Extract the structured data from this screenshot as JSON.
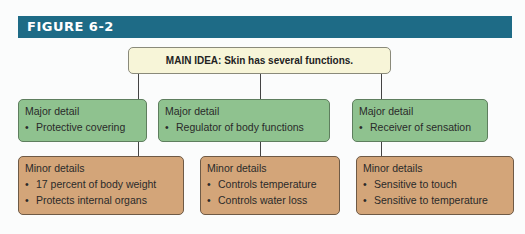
{
  "figure": {
    "label": "FIGURE 6-2",
    "header_color": "#1e6b86"
  },
  "main_idea": {
    "text": "MAIN IDEA: Skin has several functions."
  },
  "columns": [
    {
      "major": {
        "title": "Major detail",
        "items": [
          "Protective covering"
        ]
      },
      "minor": {
        "title": "Minor details",
        "items": [
          "17 percent of body weight",
          "Protects internal organs"
        ]
      }
    },
    {
      "major": {
        "title": "Major detail",
        "items": [
          "Regulator of body functions"
        ]
      },
      "minor": {
        "title": "Minor details",
        "items": [
          "Controls temperature",
          "Controls water loss"
        ]
      }
    },
    {
      "major": {
        "title": "Major detail",
        "items": [
          "Receiver of sensation"
        ]
      },
      "minor": {
        "title": "Minor details",
        "items": [
          "Sensitive to touch",
          "Sensitive to temperature"
        ]
      }
    }
  ],
  "colors": {
    "main_box": "#f7f5d8",
    "major_box": "#8fc28f",
    "minor_box": "#d3a579"
  },
  "bullet_glyph": "•"
}
